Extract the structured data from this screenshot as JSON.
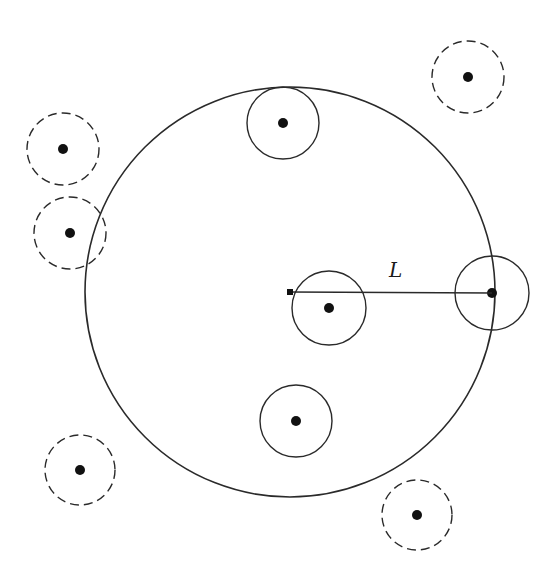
{
  "diagram": {
    "stroke_color": "#2a2a2a",
    "dot_color": "#111111",
    "background": "#ffffff",
    "large_circle": {
      "cx": 290,
      "cy": 292,
      "r": 205
    },
    "center_marker": {
      "x": 290,
      "y": 292,
      "size": 6
    },
    "radius_line": {
      "x1": 290,
      "y1": 292,
      "x2": 492,
      "y2": 293
    },
    "radius_label": {
      "text": "L",
      "x": 389,
      "y": 277
    },
    "solid_circles": [
      {
        "cx": 283,
        "cy": 123,
        "r": 36
      },
      {
        "cx": 329,
        "cy": 308,
        "r": 37
      },
      {
        "cx": 296,
        "cy": 421,
        "r": 36
      },
      {
        "cx": 492,
        "cy": 293,
        "r": 37
      }
    ],
    "dashed_circles": [
      {
        "cx": 63,
        "cy": 149,
        "r": 36
      },
      {
        "cx": 70,
        "cy": 233,
        "r": 36
      },
      {
        "cx": 468,
        "cy": 77,
        "r": 36
      },
      {
        "cx": 80,
        "cy": 470,
        "r": 35
      },
      {
        "cx": 417,
        "cy": 515,
        "r": 35
      }
    ],
    "dot_radius": 5
  }
}
